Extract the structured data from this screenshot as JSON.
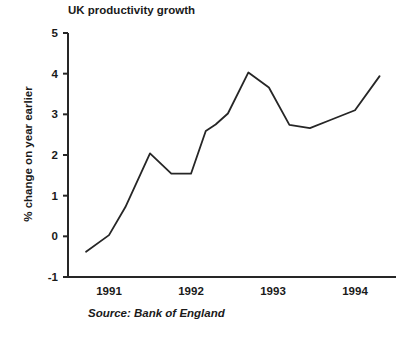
{
  "chart_data": {
    "type": "line",
    "title": "UK productivity growth",
    "xlabel": "",
    "ylabel": "% change on year earlier",
    "ylim": [
      -1,
      5
    ],
    "yticks": [
      -1,
      0,
      1,
      2,
      3,
      4,
      5
    ],
    "ytick_labels": [
      "-1",
      "0",
      "1",
      "2",
      "3",
      "4",
      "5"
    ],
    "xlim": [
      1990.5,
      1994.5
    ],
    "xticks": [
      1991,
      1992,
      1993,
      1994
    ],
    "xtick_labels": [
      "1991",
      "1992",
      "1993",
      "1994"
    ],
    "grid": false,
    "legend": "none",
    "line_color": "#262626",
    "series": [
      {
        "name": "UK productivity growth",
        "x": [
          1990.72,
          1991.0,
          1991.2,
          1991.5,
          1991.76,
          1992.0,
          1992.18,
          1992.3,
          1992.45,
          1992.7,
          1992.95,
          1993.2,
          1993.45,
          1993.7,
          1994.0,
          1994.3
        ],
        "values": [
          -0.38,
          0.03,
          0.72,
          2.04,
          1.54,
          1.54,
          2.59,
          2.75,
          3.02,
          4.03,
          3.66,
          2.74,
          2.66,
          2.86,
          3.1,
          3.94
        ]
      }
    ],
    "annotations": [
      {
        "name": "source-note",
        "text": "Source: Bank of England"
      }
    ]
  },
  "source": {
    "label": "Source: Bank of England"
  }
}
